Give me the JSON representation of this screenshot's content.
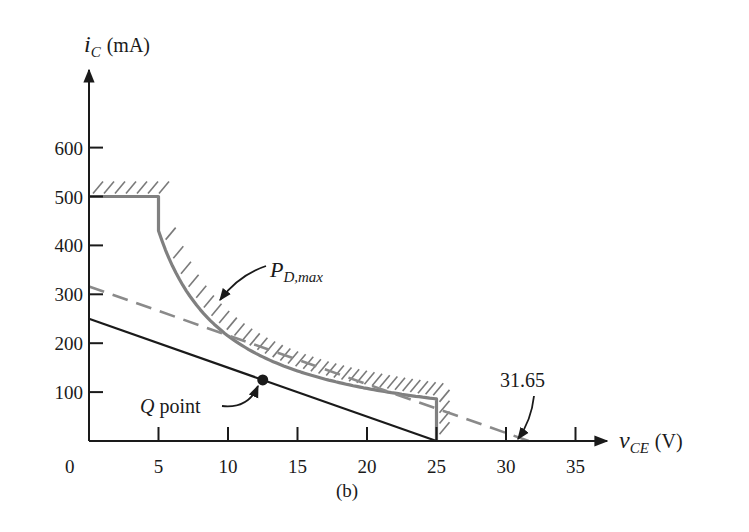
{
  "chart_data": {
    "type": "line",
    "title": "",
    "caption": "(b)",
    "xlabel": "v_CE (V)",
    "xlabel_main": "v",
    "xlabel_sub": "CE",
    "xlabel_unit": "(V)",
    "ylabel": "i_C (mA)",
    "ylabel_main": "i",
    "ylabel_sub": "C",
    "ylabel_unit": "(mA)",
    "xlim": [
      0,
      36
    ],
    "ylim": [
      0,
      650
    ],
    "grid": false,
    "x_ticks": [
      0,
      5,
      10,
      15,
      20,
      25,
      30,
      35
    ],
    "y_ticks": [
      100,
      200,
      300,
      400,
      500,
      600
    ],
    "series": [
      {
        "name": "SOA boundary (I_C,max, P_D,max hyperbola, BV_CEO)",
        "style": "solid gray thick, hatched outside",
        "color": "#808080",
        "points": [
          [
            0,
            500
          ],
          [
            5,
            500
          ],
          [
            6,
            416.7
          ],
          [
            8,
            312.5
          ],
          [
            10,
            250
          ],
          [
            12,
            208.3
          ],
          [
            14,
            178.6
          ],
          [
            16,
            156.3
          ],
          [
            18,
            138.9
          ],
          [
            20,
            125
          ],
          [
            22,
            113.6
          ],
          [
            25,
            100
          ],
          [
            25,
            86
          ],
          [
            25,
            0
          ]
        ]
      },
      {
        "name": "Load line (solid)",
        "style": "solid black",
        "color": "#1a1a1a",
        "points": [
          [
            0,
            250
          ],
          [
            25,
            0
          ]
        ]
      },
      {
        "name": "Load line tangent to P_D,max (dashed)",
        "style": "dashed gray",
        "color": "#888888",
        "points": [
          [
            0,
            316
          ],
          [
            31.65,
            0
          ]
        ]
      }
    ],
    "markers": [
      {
        "name": "Q point",
        "x": 12.5,
        "y": 125
      }
    ],
    "annotations": [
      {
        "text": "P_D,max",
        "main": "P",
        "sub": "D,max",
        "target": [
          9.6,
          260
        ]
      },
      {
        "text": "Q point",
        "target": [
          12.5,
          125
        ]
      },
      {
        "text": "31.65",
        "target": [
          31.65,
          0
        ]
      }
    ]
  },
  "labels": {
    "q_point_q": "Q",
    "q_point_rest": " point",
    "pd_main": "P",
    "pd_sub": "D,max",
    "x_intercept": "31.65",
    "caption": "(b)",
    "origin": "0"
  },
  "colors": {
    "axis": "#1a1a1a",
    "boundary": "#808080",
    "dashed": "#8a8a8a",
    "loadline": "#1a1a1a"
  }
}
